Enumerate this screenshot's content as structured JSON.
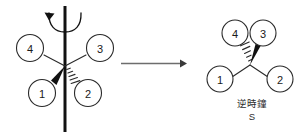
{
  "figure": {
    "background_color": "#ffffff",
    "ink_color": "#2a2a2a"
  },
  "left_structure": {
    "name": "wedge-dash-projection-on-axis",
    "axis": {
      "name": "vertical-rotation-axis",
      "color": "#111111"
    },
    "rotation_arrow": {
      "name": "curved-rotation-arrow",
      "direction": "counterclockwise"
    },
    "substituents": [
      {
        "id": "4",
        "label": "4",
        "position": "upper-left",
        "bond": "plain"
      },
      {
        "id": "3",
        "label": "3",
        "position": "upper-right",
        "bond": "plain"
      },
      {
        "id": "1",
        "label": "1",
        "position": "lower-left",
        "bond": "wedge"
      },
      {
        "id": "2",
        "label": "2",
        "position": "lower-right",
        "bond": "hash"
      }
    ]
  },
  "reaction_arrow": {
    "name": "reaction-arrow",
    "direction": "right",
    "color": "#6d6d6d",
    "label": ""
  },
  "right_structure": {
    "name": "rotated-stereocenter",
    "substituents": [
      {
        "id": "4",
        "label": "4",
        "position": "upper-left",
        "bond": "hash"
      },
      {
        "id": "3",
        "label": "3",
        "position": "upper-right",
        "bond": "wedge"
      },
      {
        "id": "1",
        "label": "1",
        "position": "lower-left",
        "bond": "plain"
      },
      {
        "id": "2",
        "label": "2",
        "position": "lower-right",
        "bond": "plain"
      }
    ],
    "caption": {
      "direction_text": "逆時鐘",
      "descriptor": "S"
    }
  }
}
